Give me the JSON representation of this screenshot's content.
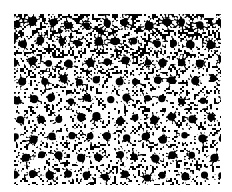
{
  "image": {
    "description": "Binarized black-and-white micrograph of densely packed ring-shaped cells",
    "left": 14,
    "top": 14,
    "width": 207,
    "height": 171,
    "colors": {
      "dark": "#000000",
      "light": "#ffffff"
    },
    "seed": 7,
    "grid": {
      "cols": 11,
      "rows": 9
    }
  }
}
